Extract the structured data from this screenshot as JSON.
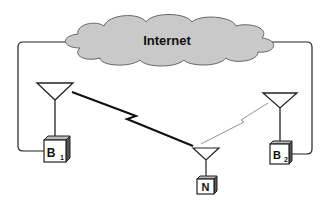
{
  "diagram": {
    "cloud": {
      "label": "Internet",
      "fill": "#c9c9c9",
      "stroke": "#555555"
    },
    "base_stations": [
      {
        "id": "B1",
        "letter": "B",
        "subscript": "1"
      },
      {
        "id": "B2",
        "letter": "B",
        "subscript": "2"
      }
    ],
    "node": {
      "id": "N",
      "letter": "N"
    },
    "links": [
      {
        "from": "B1",
        "to": "N",
        "style": "thick-zigzag"
      },
      {
        "from": "B2",
        "to": "N",
        "style": "thin-zigzag"
      },
      {
        "from": "Internet",
        "to": "B1",
        "style": "wire"
      },
      {
        "from": "Internet",
        "to": "B2",
        "style": "wire"
      }
    ]
  }
}
